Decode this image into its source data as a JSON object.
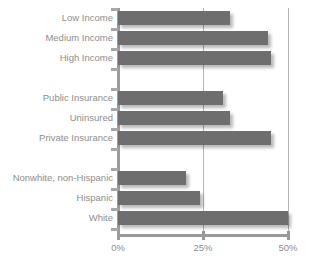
{
  "chart_data": {
    "type": "bar",
    "orientation": "horizontal",
    "title": "",
    "subtitle": "",
    "xlabel": "",
    "ylabel": "",
    "xlim": [
      0,
      50
    ],
    "grid": true,
    "gridlines": [
      25,
      50
    ],
    "legend": "none",
    "xticks": [
      {
        "value": 0,
        "label": "0%"
      },
      {
        "value": 25,
        "label": "25%"
      },
      {
        "value": 50,
        "label": "50%"
      }
    ],
    "categories": [
      "Low Income",
      "Medium Income",
      "High Income",
      "Public Insurance",
      "Uninsured",
      "Private Insurance",
      "Nonwhite, non-Hispanic",
      "Hispanic",
      "White"
    ],
    "values": [
      33,
      44,
      45,
      31,
      33,
      45,
      20,
      24,
      50
    ],
    "groups": [
      {
        "name": "Income",
        "categories": [
          "Low Income",
          "Medium Income",
          "High Income"
        ],
        "values": [
          33,
          44,
          45
        ]
      },
      {
        "name": "Insurance",
        "categories": [
          "Public Insurance",
          "Uninsured",
          "Private Insurance"
        ],
        "values": [
          31,
          33,
          45
        ]
      },
      {
        "name": "Race/Ethnicity",
        "categories": [
          "Nonwhite, non-Hispanic",
          "Hispanic",
          "White"
        ],
        "values": [
          20,
          24,
          50
        ]
      }
    ],
    "colors": {
      "bar": "#6e6e6e",
      "axis": "#9a9a9a",
      "gridline": "#b4b4b4",
      "text": "#8d8d8d",
      "background": "#ffffff"
    }
  },
  "rows": [
    {
      "label": "Low Income",
      "value": 33,
      "slot": 0
    },
    {
      "label": "Medium Income",
      "value": 44,
      "slot": 1
    },
    {
      "label": "High Income",
      "value": 45,
      "slot": 2
    },
    {
      "label": "Public Insurance",
      "value": 31,
      "slot": 4
    },
    {
      "label": "Uninsured",
      "value": 33,
      "slot": 5
    },
    {
      "label": "Private Insurance",
      "value": 45,
      "slot": 6
    },
    {
      "label": "Nonwhite, non-Hispanic",
      "value": 20,
      "slot": 8
    },
    {
      "label": "Hispanic",
      "value": 24,
      "slot": 9
    },
    {
      "label": "White",
      "value": 50,
      "slot": 10
    }
  ]
}
